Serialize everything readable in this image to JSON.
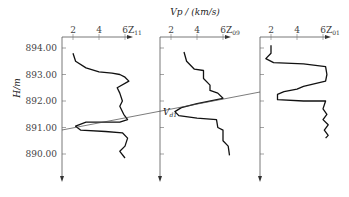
{
  "chart_data": {
    "type": "line",
    "title": "Vp / (km/s)",
    "ylabel": "H/m",
    "y_ticks": [
      "894.00",
      "893.00",
      "892.00",
      "891.00",
      "890.00"
    ],
    "ylim": [
      889.6,
      894.6
    ],
    "x_ticks": [
      "2",
      "4",
      "6"
    ],
    "xlim": [
      2,
      6.5
    ],
    "annotation": "Vd1",
    "series": [
      {
        "name": "Z11",
        "label_main": "Z",
        "label_sub": "11",
        "points": [
          [
            2.0,
            893.8
          ],
          [
            2.2,
            893.5
          ],
          [
            3.0,
            893.25
          ],
          [
            4.0,
            893.1
          ],
          [
            5.0,
            893.05
          ],
          [
            5.6,
            893.0
          ],
          [
            6.0,
            892.9
          ],
          [
            6.3,
            892.75
          ],
          [
            5.4,
            892.5
          ],
          [
            5.6,
            892.3
          ],
          [
            5.8,
            892.0
          ],
          [
            5.6,
            891.8
          ],
          [
            5.9,
            891.5
          ],
          [
            6.2,
            891.3
          ],
          [
            5.6,
            891.2
          ],
          [
            3.0,
            891.2
          ],
          [
            2.2,
            891.05
          ],
          [
            2.6,
            890.9
          ],
          [
            4.5,
            890.85
          ],
          [
            5.8,
            890.8
          ],
          [
            6.2,
            890.6
          ],
          [
            6.0,
            890.3
          ],
          [
            5.6,
            890.1
          ],
          [
            6.0,
            889.85
          ]
        ]
      },
      {
        "name": "Z09",
        "label_main": "Z",
        "label_sub": "09",
        "points": [
          [
            3.0,
            893.85
          ],
          [
            3.2,
            893.5
          ],
          [
            3.8,
            893.2
          ],
          [
            4.5,
            893.15
          ],
          [
            4.5,
            892.85
          ],
          [
            5.0,
            892.6
          ],
          [
            5.0,
            892.4
          ],
          [
            5.6,
            892.3
          ],
          [
            6.0,
            892.1
          ],
          [
            4.0,
            891.9
          ],
          [
            2.8,
            891.75
          ],
          [
            2.3,
            891.6
          ],
          [
            2.6,
            891.45
          ],
          [
            4.0,
            891.35
          ],
          [
            5.5,
            891.3
          ],
          [
            5.6,
            891.0
          ],
          [
            6.0,
            890.9
          ],
          [
            6.0,
            890.5
          ],
          [
            6.4,
            890.3
          ],
          [
            6.5,
            889.95
          ]
        ]
      },
      {
        "name": "Z01",
        "label_main": "Z",
        "label_sub": "01",
        "points": [
          [
            2.0,
            894.1
          ],
          [
            2.0,
            893.8
          ],
          [
            1.6,
            893.6
          ],
          [
            2.2,
            893.45
          ],
          [
            4.5,
            893.4
          ],
          [
            6.2,
            893.3
          ],
          [
            6.3,
            893.0
          ],
          [
            6.2,
            892.75
          ],
          [
            4.5,
            892.55
          ],
          [
            4.0,
            892.45
          ],
          [
            3.0,
            892.35
          ],
          [
            2.5,
            892.25
          ],
          [
            2.5,
            892.05
          ],
          [
            4.5,
            892.0
          ],
          [
            6.2,
            892.0
          ],
          [
            6.0,
            891.7
          ],
          [
            6.3,
            891.5
          ],
          [
            6.0,
            891.3
          ],
          [
            6.4,
            891.1
          ],
          [
            6.1,
            890.9
          ],
          [
            6.4,
            890.7
          ],
          [
            6.2,
            890.6
          ]
        ]
      }
    ],
    "correlation_line": {
      "from": [
        62,
        130
      ],
      "to": [
        260,
        92
      ]
    }
  }
}
